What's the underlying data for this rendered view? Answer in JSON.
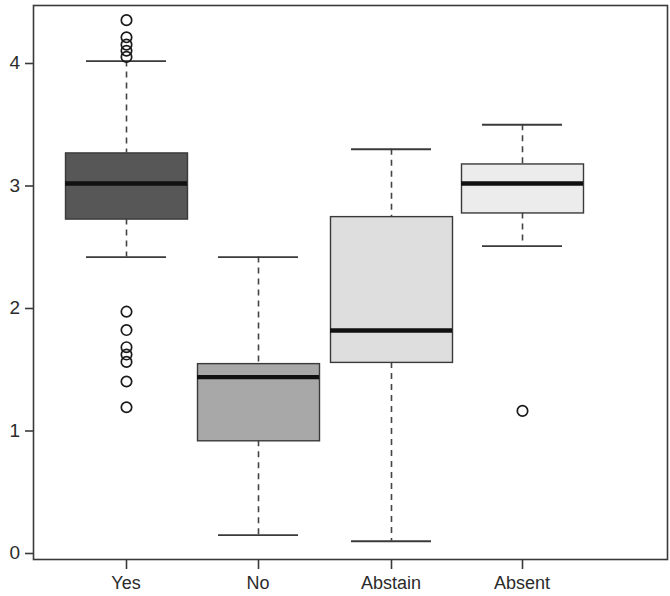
{
  "chart_data": {
    "type": "box",
    "title": "",
    "xlabel": "",
    "ylabel": "",
    "categories": [
      "Yes",
      "No",
      "Abstain",
      "Absent"
    ],
    "ylim": [
      -0.13,
      4.5
    ],
    "y_ticks": [
      0,
      1,
      2,
      3,
      4
    ],
    "y_tick_labels": [
      "0",
      "1",
      "2",
      "3",
      "4"
    ],
    "grid": false,
    "legend": "none",
    "boxes": [
      {
        "category": "Yes",
        "fill": "#575757",
        "whisker_low": 2.42,
        "q1": 2.73,
        "median": 3.02,
        "q3": 3.27,
        "whisker_high": 4.02,
        "outliers": [
          4.35,
          4.21,
          4.15,
          4.1,
          4.05,
          1.97,
          1.82,
          1.68,
          1.62,
          1.56,
          1.4,
          1.19
        ]
      },
      {
        "category": "No",
        "fill": "#a8a8a8",
        "whisker_low": 0.15,
        "q1": 0.92,
        "median": 1.44,
        "q3": 1.55,
        "whisker_high": 2.42,
        "outliers": []
      },
      {
        "category": "Abstain",
        "fill": "#dedede",
        "whisker_low": 0.1,
        "q1": 1.56,
        "median": 1.82,
        "q3": 2.75,
        "whisker_high": 3.3,
        "outliers": []
      },
      {
        "category": "Absent",
        "fill": "#ececec",
        "whisker_low": 2.51,
        "q1": 2.78,
        "median": 3.02,
        "q3": 3.18,
        "whisker_high": 3.5,
        "outliers": [
          1.16
        ]
      }
    ]
  },
  "axes": {
    "frame_color": "#3a3a3a",
    "median_color": "#111111",
    "outlier_color": "#1a1a1a"
  }
}
